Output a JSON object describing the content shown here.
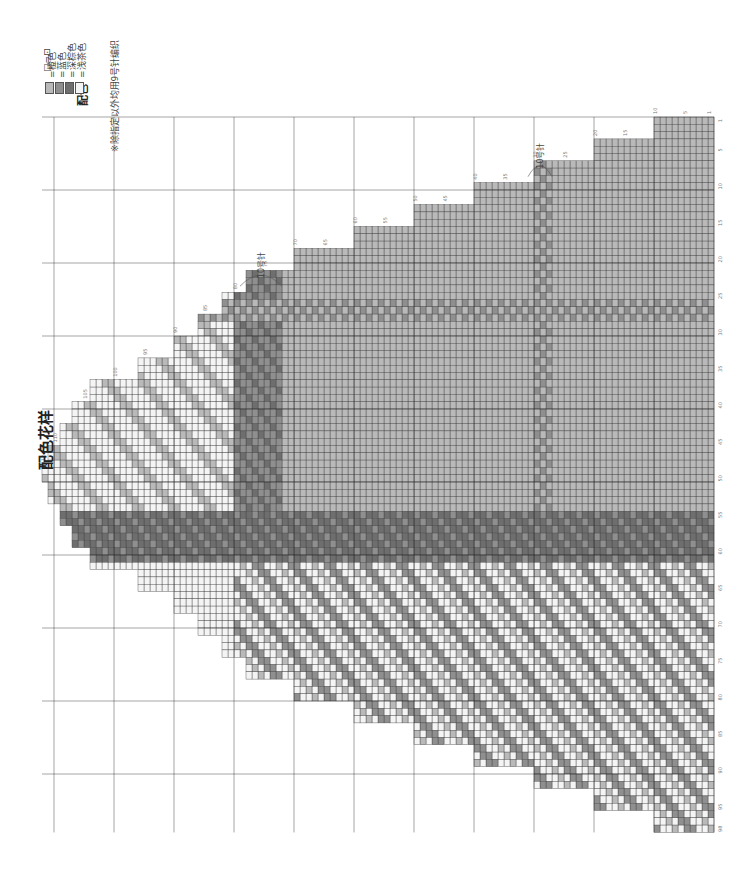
{
  "title": "配色花样",
  "legend": {
    "knit_symbol": "□=⊡",
    "group_label": "配色",
    "items": [
      {
        "label": "=橙色",
        "color": "#b9b9b9"
      },
      {
        "label": "=蓝色",
        "color": "#8f8f8f"
      },
      {
        "label": "=深棕色",
        "color": "#6e6e6e"
      },
      {
        "label": "=浅茶色",
        "color": "#f4f4f4"
      }
    ],
    "note": "※除指定以外均用9号针编织"
  },
  "needle_annotations": [
    {
      "label": "10号针",
      "row_from": 73,
      "row_to": 79
    },
    {
      "label": "10号针",
      "row_from": 28,
      "row_to": 31
    }
  ],
  "grid": {
    "rows_total": 112,
    "stitches_total": 98,
    "row_labels": [
      1,
      5,
      10,
      15,
      20,
      25,
      30,
      35,
      40,
      45,
      50,
      55,
      60,
      65,
      70,
      75,
      80,
      85,
      90,
      95,
      100,
      105,
      110,
      112
    ],
    "stitch_labels": [
      1,
      5,
      10,
      15,
      20,
      25,
      30,
      35,
      40,
      45,
      50,
      55,
      60,
      65,
      70,
      75,
      80,
      85,
      90,
      95,
      98
    ],
    "decrease_symbol": "⋏",
    "colors": {
      "orange": "#b9b9b9",
      "blue": "#8f8f8f",
      "brown": "#6e6e6e",
      "tea": "#f4f4f4",
      "line": "#333333"
    }
  }
}
